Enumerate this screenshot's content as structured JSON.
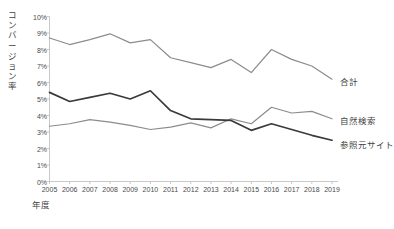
{
  "chart_data": {
    "type": "line",
    "title": "",
    "xlabel": "年度",
    "ylabel": "コンバージョン率",
    "x": [
      "2005",
      "2006",
      "2007",
      "2008",
      "2009",
      "2010",
      "2011",
      "2012",
      "2013",
      "2014",
      "2015",
      "2016",
      "2017",
      "2018",
      "2019"
    ],
    "categories": [
      "2005",
      "2006",
      "2007",
      "2008",
      "2009",
      "2010",
      "2011",
      "2012",
      "2013",
      "2014",
      "2015",
      "2016",
      "2017",
      "2018",
      "2019"
    ],
    "ylim": [
      0,
      10
    ],
    "yticks": [
      "0%",
      "1%",
      "2%",
      "3%",
      "4%",
      "5%",
      "6%",
      "7%",
      "8%",
      "9%",
      "10%"
    ],
    "ytick_values": [
      0,
      1,
      2,
      3,
      4,
      5,
      6,
      7,
      8,
      9,
      10
    ],
    "grid": false,
    "legend_position": "right-inline",
    "series": [
      {
        "name": "合計",
        "color": "#8c8c8c",
        "values": [
          8.7,
          8.3,
          8.6,
          8.95,
          8.4,
          8.6,
          7.5,
          7.2,
          6.9,
          7.4,
          6.6,
          8.0,
          7.4,
          7.0,
          6.2
        ]
      },
      {
        "name": "自然検索",
        "color": "#8c8c8c",
        "values": [
          3.35,
          3.5,
          3.75,
          3.6,
          3.4,
          3.15,
          3.3,
          3.55,
          3.25,
          3.8,
          3.5,
          4.5,
          4.15,
          4.25,
          3.8
        ]
      },
      {
        "name": "参照元サイト",
        "color": "#3a3a3a",
        "values": [
          5.4,
          4.85,
          5.1,
          5.35,
          5.0,
          5.5,
          4.3,
          3.8,
          3.75,
          3.7,
          3.1,
          3.5,
          3.15,
          2.8,
          2.5
        ]
      }
    ]
  },
  "axis": {
    "y_title": "コンバージョン率",
    "x_title": "年度"
  },
  "colors": {
    "axis_line": "#c8c8c8",
    "tick_text": "#4a4a4a",
    "label_text": "#3f3f3f",
    "series_gray": "#8c8c8c",
    "series_dark": "#3a3a3a",
    "background": "#ffffff"
  }
}
